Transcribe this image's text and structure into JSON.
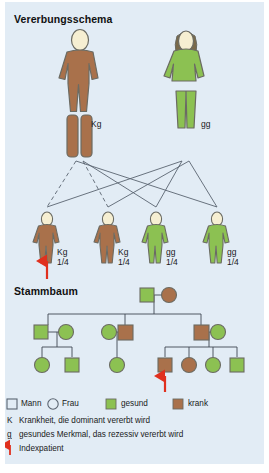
{
  "panel": {
    "background_color": "#e2ecf5",
    "sections": [
      {
        "id": "vererbungsschema",
        "title": "Vererbungsschema"
      },
      {
        "id": "stammbaum",
        "title": "Stammbaum"
      }
    ]
  },
  "colors": {
    "affected_brown": "#a9714b",
    "healthy_green": "#8cc152",
    "skin": "#f6efd2",
    "outline": "#6b6b63",
    "arrow_red": "#e0301e",
    "line": "#5a6470"
  },
  "vererbungsschema": {
    "title": "Vererbungsschema",
    "parents": [
      {
        "role": "father",
        "sex": "male",
        "status": "krank",
        "color": "#a9714b",
        "genotype": "Kg"
      },
      {
        "role": "mother",
        "sex": "female",
        "status": "gesund",
        "color": "#8cc152",
        "genotype": "gg"
      }
    ],
    "children": [
      {
        "index": 1,
        "status": "krank",
        "color": "#a9714b",
        "genotype": "Kg",
        "probability": "1/4",
        "index_patient": true
      },
      {
        "index": 2,
        "status": "krank",
        "color": "#a9714b",
        "genotype": "Kg",
        "probability": "1/4",
        "index_patient": false
      },
      {
        "index": 3,
        "status": "gesund",
        "color": "#8cc152",
        "genotype": "gg",
        "probability": "1/4",
        "index_patient": false
      },
      {
        "index": 4,
        "status": "gesund",
        "color": "#8cc152",
        "genotype": "gg",
        "probability": "1/4",
        "index_patient": false
      }
    ]
  },
  "stammbaum": {
    "title": "Stammbaum",
    "generation1": [
      {
        "sex": "male",
        "shape": "square",
        "status": "gesund",
        "color": "#8cc152"
      },
      {
        "sex": "female",
        "shape": "circle",
        "status": "krank",
        "color": "#a9714b"
      }
    ],
    "generation2": [
      {
        "sex": "male",
        "shape": "square",
        "status": "gesund",
        "color": "#8cc152"
      },
      {
        "sex": "female",
        "shape": "circle",
        "status": "gesund",
        "color": "#8cc152"
      },
      {
        "sex": "female",
        "shape": "circle",
        "status": "gesund",
        "color": "#8cc152"
      },
      {
        "sex": "male",
        "shape": "square",
        "status": "krank",
        "color": "#a9714b"
      },
      {
        "sex": "male",
        "shape": "square",
        "status": "krank",
        "color": "#a9714b"
      },
      {
        "sex": "female",
        "shape": "circle",
        "status": "gesund",
        "color": "#8cc152"
      }
    ],
    "generation3": [
      {
        "sex": "female",
        "shape": "circle",
        "status": "gesund",
        "color": "#8cc152"
      },
      {
        "sex": "male",
        "shape": "square",
        "status": "gesund",
        "color": "#8cc152"
      },
      {
        "sex": "female",
        "shape": "circle",
        "status": "gesund",
        "color": "#8cc152"
      },
      {
        "sex": "male",
        "shape": "square",
        "status": "krank",
        "color": "#a9714b",
        "index_patient": true
      },
      {
        "sex": "female",
        "shape": "circle",
        "status": "krank",
        "color": "#a9714b"
      },
      {
        "sex": "female",
        "shape": "circle",
        "status": "gesund",
        "color": "#8cc152"
      },
      {
        "sex": "male",
        "shape": "square",
        "status": "gesund",
        "color": "#8cc152"
      }
    ]
  },
  "legend": {
    "symbols": [
      {
        "icon": "square-outline",
        "label": "Mann"
      },
      {
        "icon": "circle-outline",
        "label": "Frau"
      },
      {
        "icon": "green-square",
        "label": "gesund",
        "color": "#8cc152"
      },
      {
        "icon": "brown-square",
        "label": "krank",
        "color": "#a9714b"
      }
    ],
    "rows": [
      {
        "code": "K",
        "underline": false,
        "text": "Krankheit, die dominant vererbt wird"
      },
      {
        "code": "g",
        "underline": true,
        "text": "gesundes Merkmal, das rezessiv vererbt wird"
      },
      {
        "code": "arrow-up-icon",
        "underline": false,
        "text": "Indexpatient"
      }
    ]
  }
}
